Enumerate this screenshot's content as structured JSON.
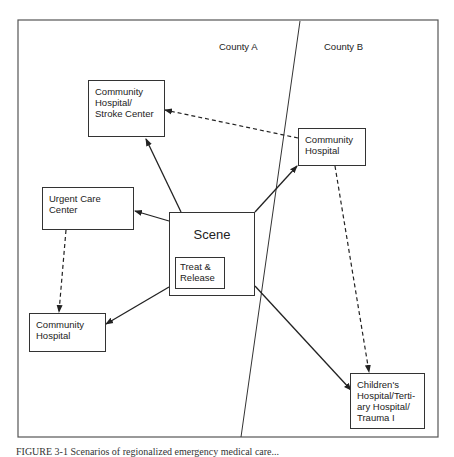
{
  "regions": {
    "county_a": "County A",
    "county_b": "County B"
  },
  "nodes": {
    "stroke_center": "Community Hospital/ Stroke Center",
    "community_hospital_b": "Community Hospital",
    "urgent_care": "Urgent Care Center",
    "scene": "Scene",
    "treat_release": "Treat & Release",
    "community_hospital_a": "Community Hospital",
    "childrens": "Children's Hospital/Terti- ary Hospital/ Trauma I"
  },
  "edges": [
    {
      "from": "scene",
      "to": "stroke_center",
      "style": "solid"
    },
    {
      "from": "scene",
      "to": "urgent_care",
      "style": "solid"
    },
    {
      "from": "scene",
      "to": "community_hospital_a",
      "style": "solid"
    },
    {
      "from": "scene",
      "to": "community_hospital_b",
      "style": "solid"
    },
    {
      "from": "scene",
      "to": "childrens",
      "style": "solid"
    },
    {
      "from": "community_hospital_b",
      "to": "stroke_center",
      "style": "dashed"
    },
    {
      "from": "urgent_care",
      "to": "community_hospital_a",
      "style": "dashed"
    },
    {
      "from": "community_hospital_b",
      "to": "childrens",
      "style": "dashed"
    }
  ],
  "caption": "FIGURE 3-1 Scenarios of regionalized emergency medical care..."
}
